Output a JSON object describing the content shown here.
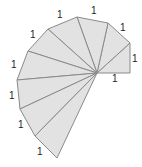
{
  "diagram": {
    "center": [
      97,
      73
    ],
    "vertices": [
      [
        130,
        73
      ],
      [
        130,
        43
      ],
      [
        108,
        23
      ],
      [
        77,
        17
      ],
      [
        48,
        29
      ],
      [
        28,
        51
      ],
      [
        17,
        80
      ],
      [
        20,
        109
      ],
      [
        35,
        136
      ],
      [
        57,
        158
      ]
    ],
    "fill_color": "#e2e2e2",
    "stroke_color": "#8a8a8a",
    "labels": [
      {
        "text": "1",
        "x": 112,
        "y": 82
      },
      {
        "text": "1",
        "x": 132,
        "y": 62
      },
      {
        "text": "1",
        "x": 120,
        "y": 31
      },
      {
        "text": "1",
        "x": 91,
        "y": 14
      },
      {
        "text": "1",
        "x": 57,
        "y": 18
      },
      {
        "text": "1",
        "x": 30,
        "y": 38
      },
      {
        "text": "1",
        "x": 11,
        "y": 68
      },
      {
        "text": "1",
        "x": 9,
        "y": 99
      },
      {
        "text": "1",
        "x": 18,
        "y": 128
      },
      {
        "text": "1",
        "x": 37,
        "y": 155
      }
    ]
  }
}
